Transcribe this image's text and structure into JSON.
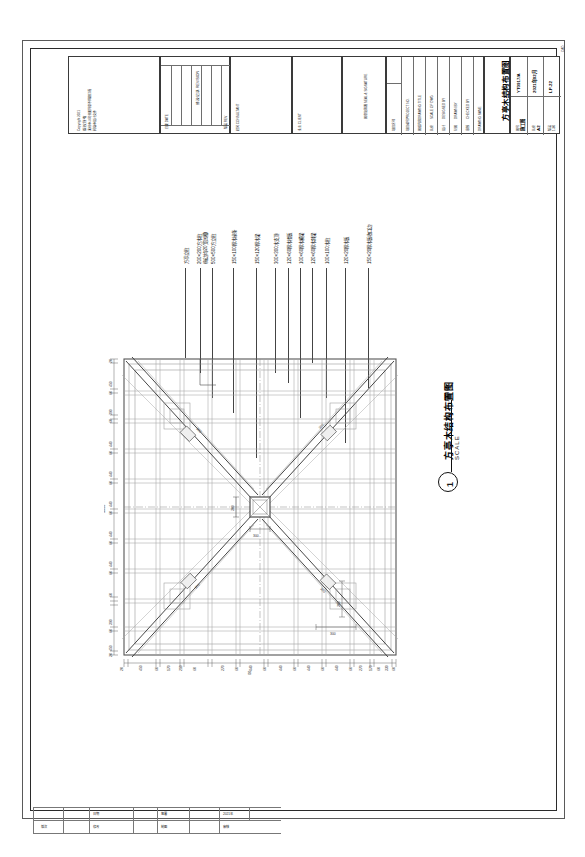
{
  "sheet": {
    "sheet_code": "CAD",
    "drawing_title": "方亭木结构布置图",
    "scale_word": "SCALE",
    "scale_value": "1:30",
    "detail_number": "1"
  },
  "titleblock": {
    "notes": {
      "copyright_line": "Copyright  2021",
      "line1": "版权所有",
      "line2": "未经本公司书面同意不得翻印或",
      "line3": "转载本设计文件"
    },
    "revision_header": "修改记录\nREVISION",
    "revision_col_left": "日期\nDATE",
    "revision_col_right": "版次\nREV",
    "consultant_label": "顾问\nCONSULTANT",
    "client_label": "业主\nCLIENT",
    "seal_label": "图章及签署\nSEAL & SIGNATURE",
    "rows": [
      {
        "cn": "项目名称",
        "en": "PROJECT NAME",
        "value": ""
      },
      {
        "cn": "项目编号",
        "en": "PROJECT NO.",
        "value": ""
      },
      {
        "cn": "图纸内容",
        "en": "DRAWING TITLE",
        "value": ""
      },
      {
        "cn": "比例",
        "en": "SCALE OF DWG",
        "value": ""
      },
      {
        "cn": "设计",
        "en": "DESIGNED BY",
        "value": ""
      },
      {
        "cn": "制图",
        "en": "DRAWN BY",
        "value": ""
      },
      {
        "cn": "审核",
        "en": "CHECKED BY",
        "value": ""
      }
    ],
    "drawing_name_cn": "方亭木结构布置图",
    "drawing_name_en": "DRAWING  NAME",
    "meta": [
      {
        "label_cn": "图号",
        "label_en": "DWG NO.",
        "value": "YT0917/A"
      },
      {
        "label_cn": "阶段",
        "label_en": "STAGE",
        "value": "施工图"
      },
      {
        "label_cn": "比例",
        "label_en": "SCALE",
        "value": "1:30"
      },
      {
        "label_cn": "日期",
        "label_en": "DATE",
        "value": "2021年02月"
      },
      {
        "label_cn": "版次",
        "label_en": "REV",
        "value": "A"
      },
      {
        "label_cn": "图幅",
        "label_en": "SIZE",
        "value": "A2"
      },
      {
        "label_cn": "编号",
        "label_en": "NO.",
        "value": "LP-22"
      }
    ]
  },
  "callouts": [
    {
      "id": "c1",
      "text": "方亭立柱"
    },
    {
      "id": "c2",
      "text": "200×200方木柱"
    },
    {
      "id": "c3",
      "text": "(每边均20宽凹槽)"
    },
    {
      "id": "c4",
      "text": "500×500方立柱"
    },
    {
      "id": "c5",
      "text": "150×100厚木椽条"
    },
    {
      "id": "c6",
      "text": "150×120厚木梁"
    },
    {
      "id": "c7",
      "text": "300×300木支顶"
    },
    {
      "id": "c8",
      "text": "120×60厚木楼板"
    },
    {
      "id": "c9",
      "text": "100×60厚木横梁"
    },
    {
      "id": "c10",
      "text": "120×60厚木斜梁"
    },
    {
      "id": "c11",
      "text": "100×100木柱"
    },
    {
      "id": "c12",
      "text": "120×20厚木板"
    },
    {
      "id": "c13",
      "text": "150×20厚木板收口边"
    }
  ],
  "plan": {
    "overall_x": "5000",
    "overall_y": "5000",
    "center_dim_v": "300",
    "center_dim_h": "300",
    "hip_dim_1": "300",
    "hip_dim_2": "300",
    "hip_dim_3": "300",
    "hip_dim_4": "300",
    "dims_bottom": [
      "20",
      "450",
      "60",
      "170",
      "60",
      "210",
      "60",
      "170",
      "60",
      "270",
      "60",
      "440",
      "60",
      "440",
      "60",
      "440",
      "60",
      "440",
      "60",
      "270",
      "60",
      "170",
      "60",
      "330",
      "60",
      "20"
    ],
    "dims_left": [
      "20",
      "450",
      "60",
      "390",
      "60",
      "60",
      "440",
      "60",
      "440",
      "60",
      "440",
      "60",
      "440",
      "60",
      "440",
      "60",
      "60",
      "390",
      "60",
      "450",
      "20"
    ]
  },
  "revision_table": {
    "headers": [
      "版次",
      "修改内容",
      "日期",
      "签署"
    ],
    "rows": [
      [
        "",
        "",
        "",
        "",
        "日期",
        "",
        "签署",
        "2021年"
      ],
      [
        "版次",
        "",
        "修改",
        "",
        "制图",
        "",
        "审核",
        ""
      ]
    ]
  }
}
